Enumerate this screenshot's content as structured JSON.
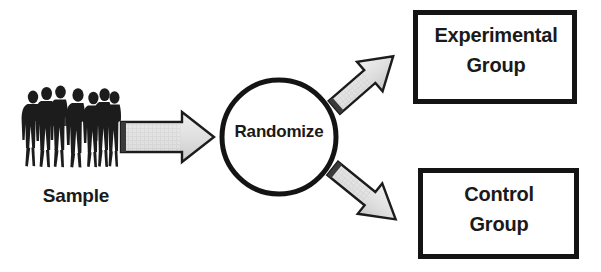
{
  "diagram": {
    "type": "randomized-controlled-trial-flow",
    "background_color": "#ffffff",
    "stroke_color": "#141414",
    "arrow_fill_color": "#e2e2e2",
    "arrow_outline_color": "#1a1a1a",
    "silhouette_color": "#1c1c1c",
    "text_color": "#1a1a1a"
  },
  "sample": {
    "label": "Sample",
    "figure_count": 7,
    "icon": "people-group-silhouette-icon"
  },
  "randomize": {
    "label": "Randomize",
    "shape": "circle"
  },
  "experimental_group": {
    "line1": "Experimental",
    "line2": "Group"
  },
  "control_group": {
    "line1": "Control",
    "line2": "Group"
  },
  "arrows": [
    {
      "name": "sample-to-randomize",
      "direction": "right"
    },
    {
      "name": "randomize-to-experimental",
      "direction": "up-right"
    },
    {
      "name": "randomize-to-control",
      "direction": "down-right"
    }
  ]
}
